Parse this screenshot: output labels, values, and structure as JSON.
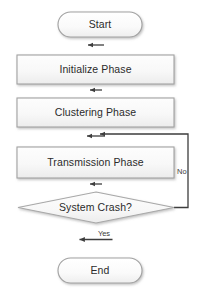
{
  "diagram": {
    "background_color": "#ffffff",
    "shape_fill_color": "#f6f6f6",
    "shape_border_color": "#a6a6a6",
    "connector_color": "#404040",
    "text_color": "#2b2b2b"
  },
  "nodes": [
    {
      "id": "start",
      "type": "terminator",
      "label": "Start",
      "x": 58,
      "y": 12,
      "width": 84,
      "height": 25
    },
    {
      "id": "initialize",
      "type": "process",
      "label": "Initialize Phase",
      "x": 17,
      "y": 55,
      "width": 157,
      "height": 29
    },
    {
      "id": "clustering",
      "type": "process",
      "label": "Clustering Phase",
      "x": 17,
      "y": 98,
      "width": 157,
      "height": 29
    },
    {
      "id": "transmission",
      "type": "process",
      "label": "Transmission Phase",
      "x": 17,
      "y": 147,
      "width": 157,
      "height": 31
    },
    {
      "id": "decision",
      "type": "decision",
      "label": "System Crash?",
      "x": 17,
      "y": 192,
      "width": 157,
      "height": 31
    },
    {
      "id": "end",
      "type": "terminator",
      "label": "End",
      "x": 58,
      "y": 258,
      "width": 84,
      "height": 25
    }
  ],
  "edges": [
    {
      "id": "start-to-initialize",
      "from": "start",
      "to": "initialize",
      "label": ""
    },
    {
      "id": "initialize-to-clustering",
      "from": "initialize",
      "to": "clustering",
      "label": ""
    },
    {
      "id": "clustering-to-transmission",
      "from": "clustering",
      "to": "transmission",
      "label": ""
    },
    {
      "id": "transmission-to-decision",
      "from": "transmission",
      "to": "decision",
      "label": ""
    },
    {
      "id": "decision-yes-to-end",
      "from": "decision",
      "to": "end",
      "label": "Yes"
    },
    {
      "id": "decision-no-loop-back",
      "from": "decision",
      "to": "transmission",
      "label": "No"
    }
  ],
  "edge_labels": {
    "yes": "Yes",
    "no": "No"
  }
}
